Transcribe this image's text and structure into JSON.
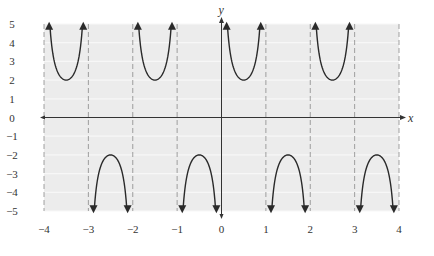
{
  "chart_data": {
    "type": "line",
    "title": "",
    "function": "y = 2 csc(pi x)",
    "xlabel": "x",
    "ylabel": "y",
    "xlim": [
      -4,
      4
    ],
    "ylim": [
      -5,
      5
    ],
    "x_ticks": [
      "−4",
      "−3",
      "−2",
      "−1",
      "0",
      "1",
      "2",
      "3",
      "4"
    ],
    "y_ticks": [
      "5",
      "4",
      "3",
      "2",
      "1",
      "0",
      "−1",
      "−2",
      "−3",
      "−4",
      "−5"
    ],
    "asymptotes": [
      -4,
      -3,
      -2,
      -1,
      0,
      1,
      2,
      3,
      4
    ],
    "grid": true,
    "legend": null,
    "branches": [
      {
        "interval": [
          -4,
          -3
        ],
        "direction": "up",
        "vertex": [
          -3.5,
          2
        ]
      },
      {
        "interval": [
          -3,
          -2
        ],
        "direction": "down",
        "vertex": [
          -2.5,
          -2
        ]
      },
      {
        "interval": [
          -2,
          -1
        ],
        "direction": "up",
        "vertex": [
          -1.5,
          2
        ]
      },
      {
        "interval": [
          -1,
          0
        ],
        "direction": "down",
        "vertex": [
          -0.5,
          -2
        ]
      },
      {
        "interval": [
          0,
          1
        ],
        "direction": "up",
        "vertex": [
          0.5,
          2
        ]
      },
      {
        "interval": [
          1,
          2
        ],
        "direction": "down",
        "vertex": [
          1.5,
          -2
        ]
      },
      {
        "interval": [
          2,
          3
        ],
        "direction": "up",
        "vertex": [
          2.5,
          2
        ]
      },
      {
        "interval": [
          3,
          4
        ],
        "direction": "down",
        "vertex": [
          3.5,
          -2
        ]
      }
    ],
    "colors": {
      "background": "#ececec",
      "grid": "#f7f7f7",
      "asymptote": "#8a8a8a",
      "curve": "#2a2a2a",
      "axis": "#333333"
    }
  }
}
